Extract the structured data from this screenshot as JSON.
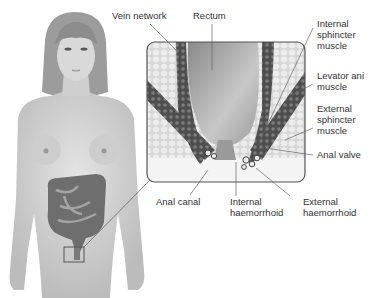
{
  "diagram": {
    "figure": "female-body-with-colon-and-rectum-inset",
    "labels": {
      "vein_network": "Vein network",
      "rectum": "Rectum",
      "internal_sphincter": "Internal\nsphincter\nmuscle",
      "levator_ani": "Levator ani\nmuscle",
      "external_sphincter": "External\nsphincter\nmuscle",
      "anal_valve": "Anal valve",
      "anal_canal": "Anal canal",
      "internal_haemorrhoid": "Internal\nhaemorrhoid",
      "external_haemorrhoid": "External\nhaemorrhoid"
    },
    "colors": {
      "skin": "#d8d8d8",
      "skin_shadow": "#bdbdbd",
      "hair": "#9a9a9a",
      "colon": "#7a7a7a",
      "inset_border": "#555555",
      "fat": "#e6e6e6",
      "muscle": "#5a5a5a",
      "rectum": "#b0b0b0",
      "text": "#333333",
      "leader": "#666666"
    }
  }
}
